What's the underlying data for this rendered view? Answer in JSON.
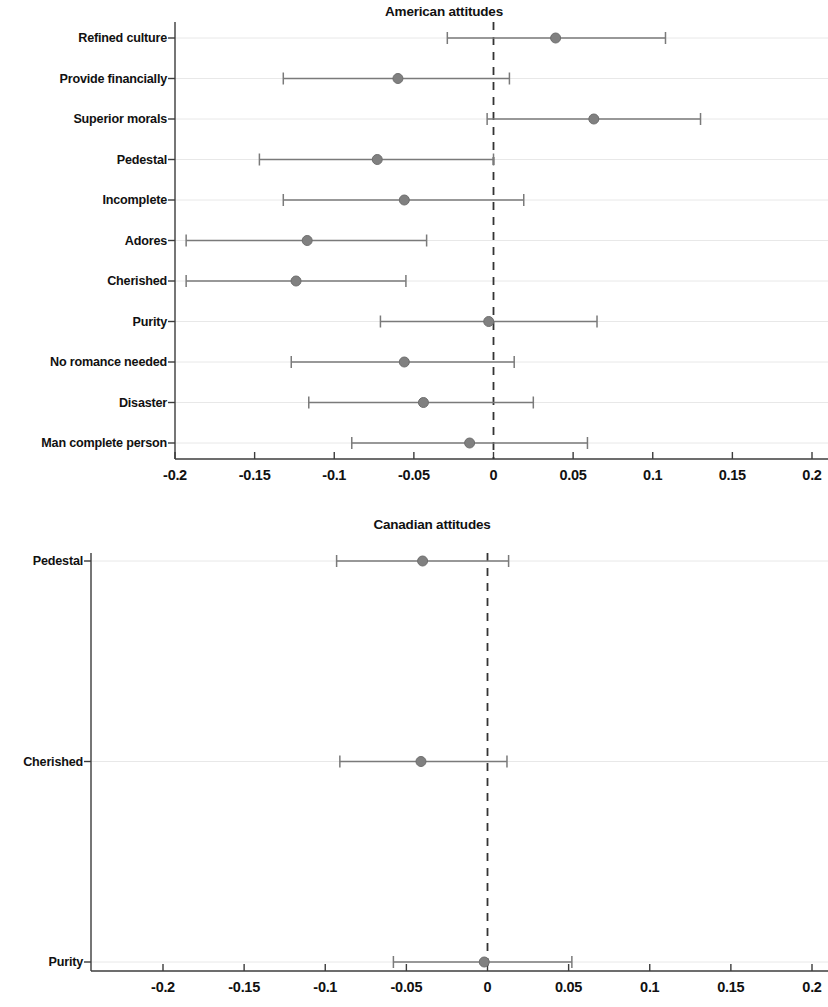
{
  "figure": {
    "kind": "forest-plot-figure",
    "background": "#ffffff",
    "point_color": "#808080",
    "line_color": "#7a7a7a",
    "axis_color": "#3c3c3c",
    "gridline_color": "#e8e8e8",
    "zero_line_color": "#333333"
  },
  "chart_data": [
    {
      "type": "scatter",
      "subtype": "forest-plot",
      "title": "American attitudes",
      "xlabel": "",
      "ylabel": "",
      "xlim": [
        -0.2,
        0.2
      ],
      "xticks": [
        -0.2,
        -0.15,
        -0.1,
        -0.05,
        0,
        0.05,
        0.1,
        0.15,
        0.2
      ],
      "xtick_labels": [
        "-0.2",
        "-0.15",
        "-0.1",
        "-0.05",
        "0",
        "0.05",
        "0.1",
        "0.15",
        "0.2"
      ],
      "grid": true,
      "legend": "none",
      "reference_line": 0,
      "categories": [
        "Refined culture",
        "Provide financially",
        "Superior morals",
        "Pedestal",
        "Incomplete",
        "Adores",
        "Cherished",
        "Purity",
        "No romance needed",
        "Disaster",
        "Man complete person"
      ],
      "points": [
        {
          "label": "Refined culture",
          "estimate": 0.039,
          "ci_low": -0.029,
          "ci_high": 0.108
        },
        {
          "label": "Provide financially",
          "estimate": -0.06,
          "ci_low": -0.132,
          "ci_high": 0.01
        },
        {
          "label": "Superior morals",
          "estimate": 0.063,
          "ci_low": -0.004,
          "ci_high": 0.13
        },
        {
          "label": "Pedestal",
          "estimate": -0.073,
          "ci_low": -0.147,
          "ci_high": 0.0
        },
        {
          "label": "Incomplete",
          "estimate": -0.056,
          "ci_low": -0.132,
          "ci_high": 0.019
        },
        {
          "label": "Adores",
          "estimate": -0.117,
          "ci_low": -0.193,
          "ci_high": -0.042
        },
        {
          "label": "Cherished",
          "estimate": -0.124,
          "ci_low": -0.193,
          "ci_high": -0.055
        },
        {
          "label": "Purity",
          "estimate": -0.003,
          "ci_low": -0.071,
          "ci_high": 0.065
        },
        {
          "label": "No romance needed",
          "estimate": -0.056,
          "ci_low": -0.127,
          "ci_high": 0.013
        },
        {
          "label": "Disaster",
          "estimate": -0.044,
          "ci_low": -0.116,
          "ci_high": 0.025
        },
        {
          "label": "Man complete person",
          "estimate": -0.015,
          "ci_low": -0.089,
          "ci_high": 0.059
        }
      ]
    },
    {
      "type": "scatter",
      "subtype": "forest-plot",
      "title": "Canadian attitudes",
      "xlabel": "",
      "ylabel": "",
      "xlim": [
        -0.2,
        0.2
      ],
      "xticks": [
        -0.2,
        -0.15,
        -0.1,
        -0.05,
        0,
        0.05,
        0.1,
        0.15,
        0.2
      ],
      "xtick_labels": [
        "-0.2",
        "-0.15",
        "-0.1",
        "-0.05",
        "0",
        "0.05",
        "0.1",
        "0.15",
        "0.2"
      ],
      "grid": true,
      "legend": "none",
      "reference_line": 0,
      "categories": [
        "Pedestal",
        "Cherished",
        "Purity"
      ],
      "points": [
        {
          "label": "Pedestal",
          "estimate": -0.04,
          "ci_low": -0.093,
          "ci_high": 0.013
        },
        {
          "label": "Cherished",
          "estimate": -0.041,
          "ci_low": -0.091,
          "ci_high": 0.012
        },
        {
          "label": "Purity",
          "estimate": -0.002,
          "ci_low": -0.058,
          "ci_high": 0.052
        }
      ]
    }
  ]
}
